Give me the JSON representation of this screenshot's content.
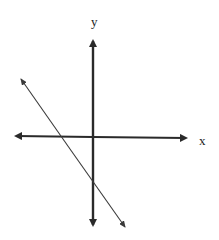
{
  "diagram": {
    "type": "coordinate-axes-with-line",
    "axes": {
      "x_label": "x",
      "y_label": "y",
      "origin_px": [
        93,
        137
      ],
      "x_axis_px": [
        15,
        187
      ],
      "y_axis_px": [
        40,
        226
      ]
    },
    "line": {
      "description": "line with negative slope, negative x-intercept and negative y-intercept",
      "from_px": [
        20,
        78
      ],
      "to_px": [
        126,
        228
      ],
      "x_intercept_sign": "negative",
      "y_intercept_sign": "negative",
      "slope_sign": "negative"
    },
    "colors": {
      "axis": "#2a2a2a",
      "line": "#3a3a3a",
      "background": "#ffffff"
    }
  }
}
